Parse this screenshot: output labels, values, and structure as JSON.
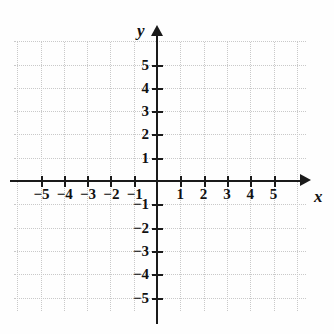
{
  "figure": {
    "kind": "cartesian-coordinate-plane",
    "top_artifact_text": "(",
    "axis_labels": {
      "x": "x",
      "y": "y"
    },
    "x_tick_labels": [
      "−5",
      "−4",
      "−3",
      "−2",
      "−1",
      "1",
      "2",
      "3",
      "4",
      "5"
    ],
    "y_tick_labels": [
      "5",
      "4",
      "3",
      "2",
      "1",
      "−1",
      "−2",
      "−3",
      "−4",
      "−5"
    ],
    "colors": {
      "axis": "#1a1a1a",
      "grid": "#c9c9c9",
      "label": "#111111",
      "background": "#fefefe"
    }
  },
  "chart_data": {
    "type": "scatter",
    "title": "",
    "xlabel": "x",
    "ylabel": "y",
    "xlim": [
      -6,
      6
    ],
    "ylim": [
      -6,
      6
    ],
    "xticks": [
      -5,
      -4,
      -3,
      -2,
      -1,
      1,
      2,
      3,
      4,
      5
    ],
    "yticks": [
      5,
      4,
      3,
      2,
      1,
      -1,
      -2,
      -3,
      -4,
      -5
    ],
    "grid": true,
    "legend": "none",
    "series": [
      {
        "name": "plotted-points",
        "x": [],
        "y": []
      }
    ],
    "annotations": []
  }
}
